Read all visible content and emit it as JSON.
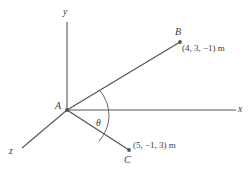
{
  "figure": {
    "type": "3d-vector-diagram",
    "background_color": "#ffffff",
    "stroke_color": "#555555",
    "text_color": "#3a3a3a",
    "axes": [
      {
        "name": "y-axis",
        "label": "y",
        "direction": "up",
        "from": [
          67,
          110
        ],
        "to": [
          67,
          22
        ]
      },
      {
        "name": "x-axis",
        "label": "x",
        "direction": "right",
        "from": [
          67,
          110
        ],
        "to": [
          236,
          110
        ]
      },
      {
        "name": "z-axis",
        "label": "z",
        "direction": "down-left",
        "from": [
          67,
          110
        ],
        "to": [
          22,
          148
        ]
      }
    ],
    "origin": {
      "label": "A",
      "x": 67,
      "y": 110
    },
    "points": [
      {
        "label": "B",
        "coordinates_text": "(4, 3, −1) m",
        "coords": [
          4,
          3,
          -1
        ],
        "units": "m",
        "x": 180,
        "y": 42
      },
      {
        "label": "C",
        "coordinates_text": "(5, −1, 3) m",
        "coords": [
          5,
          -1,
          3
        ],
        "units": "m",
        "x": 129,
        "y": 150
      }
    ],
    "segments": [
      {
        "name": "segment-AB",
        "from": [
          67,
          110
        ],
        "to": [
          180,
          42
        ]
      },
      {
        "name": "segment-AC",
        "from": [
          67,
          110
        ],
        "to": [
          129,
          150
        ]
      }
    ],
    "angle": {
      "label": "θ",
      "between": [
        "segment-AB",
        "segment-AC"
      ],
      "vertex": "A",
      "arc_radius": 38
    }
  }
}
